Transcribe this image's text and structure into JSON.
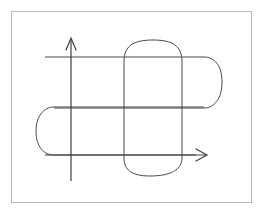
{
  "figure": {
    "canvas": {
      "width": 265,
      "height": 216
    },
    "colors": {
      "background": "#ffffff",
      "frame": "#b9b9b9",
      "ink": "#4a4a4a",
      "axis": "#3f3f3f"
    },
    "stroke_widths": {
      "frame": 1,
      "shape": 1,
      "axis": 1.2
    },
    "frame": {
      "name": "image-border",
      "x": 11,
      "y": 11,
      "width": 241,
      "height": 192
    },
    "axes": {
      "y_axis": {
        "label": "vertical-axis",
        "x": 71,
        "y_top": 38,
        "y_bottom": 181,
        "arrow": "up",
        "arrow_tip": [
          71,
          38
        ],
        "arrow_left": [
          66,
          50
        ],
        "arrow_right": [
          76,
          50
        ]
      },
      "x_axis": {
        "label": "horizontal-axis",
        "y": 155,
        "x_left": 45,
        "x_right": 207,
        "arrow": "right",
        "arrow_tip": [
          207,
          155
        ],
        "arrow_upper": [
          196,
          149
        ],
        "arrow_lower": [
          196,
          161
        ]
      }
    },
    "shapes": [
      {
        "name": "vertical-stadium",
        "orientation": "vertical",
        "description": "Tall rounded rectangle with rounded top and rounded bottom caps",
        "left": 124,
        "right": 182,
        "top": 40,
        "bottom": 176,
        "cap_radius_x": 29,
        "cap_radius_y": 18
      },
      {
        "name": "horizontal-stadium-upper-right",
        "orientation": "horizontal",
        "description": "Wide rounded rectangle with rounded right cap, open toward the left",
        "left": 45,
        "right": 222,
        "top": 57,
        "bottom": 108,
        "cap_radius_x": 18,
        "cap_radius_y": 26
      },
      {
        "name": "horizontal-stadium-lower-left",
        "orientation": "horizontal",
        "description": "Wide rounded rectangle with rounded left cap, open toward the right",
        "left": 36,
        "right": 207,
        "top": 107,
        "bottom": 155,
        "cap_radius_x": 18,
        "cap_radius_y": 24
      }
    ],
    "line_segments": {
      "top_horizontal": {
        "name": "top-horizontal-line",
        "x1": 45,
        "y1": 57,
        "x2": 204,
        "y2": 57
      },
      "middle_horizontal": {
        "name": "middle-horizontal-line",
        "x1": 54,
        "y1": 107,
        "x2": 204,
        "y2": 107
      },
      "bottom_horizontal": {
        "name": "bottom-horizontal-line",
        "x1": 54,
        "y1": 155,
        "x2": 207,
        "y2": 155
      },
      "left_vertical": {
        "name": "left-vertical-line",
        "x1": 124,
        "y1": 47,
        "x2": 124,
        "y2": 166
      },
      "right_vertical": {
        "name": "right-vertical-line",
        "x1": 182,
        "y1": 47,
        "x2": 182,
        "y2": 166
      }
    }
  }
}
